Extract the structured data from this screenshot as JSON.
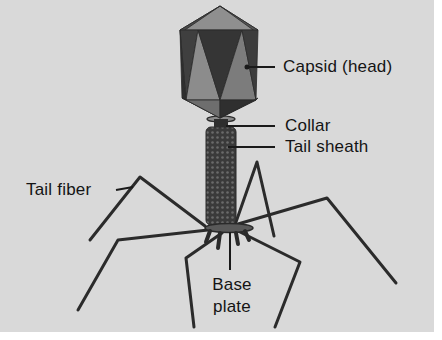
{
  "figure": {
    "background_color": "#d9d9d9",
    "line_color": "#2a2a2a"
  },
  "labels": {
    "capsid": "Capsid (head)",
    "collar": "Collar",
    "tail_sheath": "Tail sheath",
    "tail_fiber": "Tail fiber",
    "base_plate_line1": "Base",
    "base_plate_line2": "plate"
  },
  "parts": [
    {
      "name": "capsid",
      "label": "Capsid (head)"
    },
    {
      "name": "collar",
      "label": "Collar"
    },
    {
      "name": "tail-sheath",
      "label": "Tail sheath"
    },
    {
      "name": "tail-fiber",
      "label": "Tail fiber"
    },
    {
      "name": "base-plate",
      "label": "Base plate"
    }
  ]
}
